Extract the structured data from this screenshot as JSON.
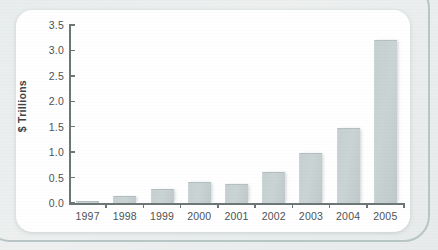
{
  "chart_data": {
    "type": "bar",
    "title": "",
    "xlabel": "",
    "ylabel": "$ Trillions",
    "categories": [
      "1997",
      "1998",
      "1999",
      "2000",
      "2001",
      "2002",
      "2003",
      "2004",
      "2005"
    ],
    "values": [
      0.03,
      0.13,
      0.27,
      0.41,
      0.37,
      0.61,
      0.99,
      1.47,
      3.21
    ],
    "ylim": [
      0.0,
      3.5
    ],
    "ytick_labels": [
      "0.0",
      "0.5",
      "1.0",
      "1.5",
      "2.0",
      "2.5",
      "3.0",
      "3.5"
    ],
    "ytick_values": [
      0.0,
      0.5,
      1.0,
      1.5,
      2.0,
      2.5,
      3.0,
      3.5
    ],
    "grid": false,
    "legend": false,
    "legend_position": "none",
    "series": [
      {
        "name": "$ Trillions",
        "values": [
          0.03,
          0.13,
          0.27,
          0.41,
          0.37,
          0.61,
          0.99,
          1.47,
          3.21
        ]
      }
    ],
    "colors": {
      "bar_fill": "#c6d0d1",
      "bar_edge": "#b3bfc0",
      "axis": "#6d7577",
      "tick_text": "#4d5356",
      "axis_title": "#3f4548",
      "card_background": "#ffffff",
      "page_background": "#eef1f1",
      "frame_border": "#b9c6c6"
    }
  }
}
